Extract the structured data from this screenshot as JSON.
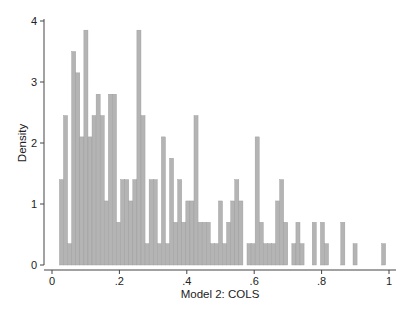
{
  "chart_data": {
    "type": "bar",
    "subtype": "histogram",
    "title": "",
    "xlabel": "Model 2: COLS",
    "ylabel": "Density",
    "xlim": [
      0,
      1
    ],
    "ylim": [
      0,
      4
    ],
    "x_ticks": [
      0,
      0.2,
      0.4,
      0.6,
      0.8,
      1
    ],
    "x_tick_labels": [
      "0",
      ".2",
      ".4",
      ".6",
      ".8",
      "1"
    ],
    "y_ticks": [
      0,
      1,
      2,
      3,
      4
    ],
    "y_tick_labels": [
      "0",
      "1",
      "2",
      "3",
      "4"
    ],
    "grid": false,
    "legend": null,
    "bin_start": 0.022,
    "bin_width": 0.0121,
    "values": [
      1.4,
      2.45,
      0.35,
      3.5,
      3.15,
      2.1,
      3.85,
      2.1,
      2.45,
      2.8,
      2.45,
      1.05,
      2.8,
      2.8,
      0.7,
      1.4,
      1.4,
      1.05,
      1.4,
      3.85,
      2.45,
      0.35,
      1.4,
      1.4,
      0.35,
      2.1,
      0.35,
      1.75,
      0.7,
      1.4,
      0.7,
      1.05,
      1.05,
      2.45,
      0.7,
      0.7,
      0.7,
      0.35,
      0.35,
      1.05,
      0.35,
      0.7,
      1.05,
      1.4,
      1.05,
      0,
      0.35,
      0.35,
      2.1,
      0.7,
      0.35,
      0.35,
      0.35,
      1.05,
      1.4,
      0.7,
      0,
      0.35,
      0.7,
      0.35,
      0,
      0,
      0.7,
      0,
      0.7,
      0.35,
      0,
      0,
      0,
      0.7,
      0,
      0,
      0.35,
      0,
      0,
      0,
      0,
      0,
      0,
      0.35
    ],
    "bar_color": "#b4b4b4",
    "bar_edge_color": "#9a9a9a",
    "axis_color": "#444444"
  }
}
